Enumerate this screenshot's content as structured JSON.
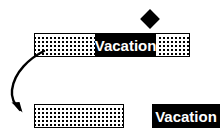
{
  "diagram": {
    "colors": {
      "ink": "#000000",
      "paper": "#ffffff",
      "label_text": "#ffffff"
    },
    "top_bar": {
      "name": "composite-bar",
      "label": "Vacation",
      "segments": [
        {
          "kind": "hatched",
          "label": ""
        },
        {
          "kind": "solid",
          "label": "Vacation"
        },
        {
          "kind": "hatched",
          "label": ""
        }
      ]
    },
    "marker": {
      "name": "diamond-marker",
      "shape": "diamond",
      "label": ""
    },
    "arrow": {
      "name": "curved-down-arrow",
      "direction": "down",
      "label": ""
    },
    "bottom_hatch_bar": {
      "name": "hatched-bar",
      "label": ""
    },
    "bottom_label_box": {
      "name": "vacation-label-box",
      "label": "Vacation"
    }
  }
}
